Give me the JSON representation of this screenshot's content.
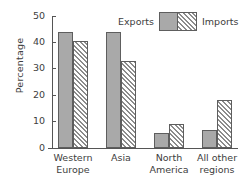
{
  "chart_data": {
    "type": "bar",
    "title": "",
    "xlabel": "",
    "ylabel": "Percentage",
    "ylim": [
      0,
      50
    ],
    "yticks": [
      0,
      10,
      20,
      30,
      40,
      50
    ],
    "grid": false,
    "legend_position": "top-right",
    "categories": [
      "Western\nEurope",
      "Asia",
      "North\nAmerica",
      "All other\nregions"
    ],
    "category_lines": [
      [
        "Western",
        "Europe"
      ],
      [
        "Asia",
        ""
      ],
      [
        "North",
        "America"
      ],
      [
        "All other",
        "regions"
      ]
    ],
    "series": [
      {
        "name": "Exports",
        "fill": "solid-gray",
        "color": "#a9a9a9",
        "values": [
          44,
          44,
          5.6,
          6.7
        ]
      },
      {
        "name": "Imports",
        "fill": "diagonal-hatch",
        "color": "#8c8c8c",
        "values": [
          40.6,
          33,
          9,
          18
        ]
      }
    ]
  },
  "legend": {
    "exports_label": "Exports",
    "imports_label": "Imports"
  },
  "axis": {
    "y_title": "Percentage",
    "tick_0": "0",
    "tick_10": "10",
    "tick_20": "20",
    "tick_30": "30",
    "tick_40": "40",
    "tick_50": "50"
  },
  "categories_text": {
    "c0_line1": "Western",
    "c0_line2": "Europe",
    "c1_line1": "Asia",
    "c1_line2": "",
    "c2_line1": "North",
    "c2_line2": "America",
    "c3_line1": "All other",
    "c3_line2": "regions"
  }
}
